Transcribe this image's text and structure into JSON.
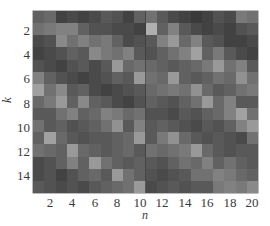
{
  "chart_data": {
    "type": "heatmap",
    "title": "",
    "xlabel": "n",
    "ylabel": "k",
    "x_ticks": [
      "2",
      "4",
      "6",
      "8",
      "10",
      "12",
      "14",
      "16",
      "18",
      "20"
    ],
    "y_ticks": [
      "2",
      "4",
      "6",
      "8",
      "10",
      "12",
      "14"
    ],
    "x_range": [
      1,
      20
    ],
    "y_range": [
      1,
      15
    ],
    "colormap": "gray",
    "color_low": "#2a2a2a",
    "color_high": "#c8c8c8",
    "grid": false,
    "divider_at_n": 10.5,
    "rows": 15,
    "cols": 20,
    "values": [
      [
        0.35,
        0.4,
        0.15,
        0.2,
        0.15,
        0.2,
        0.3,
        0.25,
        0.15,
        0.35,
        0.45,
        0.3,
        0.2,
        0.15,
        0.1,
        0.15,
        0.25,
        0.2,
        0.5,
        0.45
      ],
      [
        0.45,
        0.5,
        0.55,
        0.55,
        0.35,
        0.25,
        0.25,
        0.2,
        0.2,
        0.15,
        0.85,
        0.35,
        0.55,
        0.3,
        0.2,
        0.15,
        0.2,
        0.15,
        0.25,
        0.3
      ],
      [
        0.2,
        0.25,
        0.6,
        0.45,
        0.55,
        0.45,
        0.5,
        0.35,
        0.2,
        0.25,
        0.3,
        0.55,
        0.7,
        0.4,
        0.55,
        0.3,
        0.25,
        0.15,
        0.15,
        0.2
      ],
      [
        0.15,
        0.2,
        0.25,
        0.35,
        0.3,
        0.6,
        0.5,
        0.45,
        0.55,
        0.3,
        0.25,
        0.35,
        0.45,
        0.55,
        0.75,
        0.35,
        0.5,
        0.3,
        0.2,
        0.15
      ],
      [
        0.25,
        0.2,
        0.15,
        0.25,
        0.3,
        0.2,
        0.3,
        0.7,
        0.4,
        0.45,
        0.4,
        0.35,
        0.3,
        0.35,
        0.4,
        0.5,
        0.7,
        0.45,
        0.55,
        0.3
      ],
      [
        0.55,
        0.35,
        0.25,
        0.2,
        0.15,
        0.2,
        0.25,
        0.35,
        0.3,
        0.7,
        0.45,
        0.4,
        0.7,
        0.35,
        0.3,
        0.35,
        0.45,
        0.4,
        0.65,
        0.45
      ],
      [
        0.75,
        0.45,
        0.6,
        0.3,
        0.35,
        0.2,
        0.15,
        0.2,
        0.25,
        0.3,
        0.4,
        0.45,
        0.5,
        0.45,
        0.65,
        0.4,
        0.3,
        0.35,
        0.45,
        0.5
      ],
      [
        0.4,
        0.5,
        0.7,
        0.35,
        0.6,
        0.35,
        0.3,
        0.2,
        0.15,
        0.25,
        0.35,
        0.3,
        0.25,
        0.35,
        0.45,
        0.7,
        0.4,
        0.55,
        0.3,
        0.3
      ],
      [
        0.3,
        0.3,
        0.45,
        0.55,
        0.35,
        0.4,
        0.55,
        0.5,
        0.4,
        0.45,
        0.25,
        0.25,
        0.2,
        0.3,
        0.25,
        0.35,
        0.4,
        0.55,
        0.75,
        0.45
      ],
      [
        0.45,
        0.3,
        0.35,
        0.25,
        0.3,
        0.35,
        0.45,
        0.65,
        0.3,
        0.55,
        0.3,
        0.35,
        0.3,
        0.25,
        0.2,
        0.3,
        0.25,
        0.35,
        0.55,
        0.7
      ],
      [
        0.35,
        0.75,
        0.4,
        0.3,
        0.25,
        0.3,
        0.3,
        0.35,
        0.4,
        0.7,
        0.3,
        0.5,
        0.65,
        0.4,
        0.3,
        0.25,
        0.3,
        0.25,
        0.2,
        0.45
      ],
      [
        0.45,
        0.4,
        0.35,
        0.7,
        0.4,
        0.35,
        0.3,
        0.35,
        0.4,
        0.3,
        0.45,
        0.4,
        0.45,
        0.5,
        0.7,
        0.4,
        0.3,
        0.25,
        0.3,
        0.3
      ],
      [
        0.2,
        0.25,
        0.35,
        0.55,
        0.35,
        0.7,
        0.45,
        0.35,
        0.3,
        0.35,
        0.3,
        0.25,
        0.35,
        0.45,
        0.4,
        0.55,
        0.35,
        0.45,
        0.35,
        0.3
      ],
      [
        0.2,
        0.25,
        0.15,
        0.25,
        0.35,
        0.4,
        0.3,
        0.7,
        0.45,
        0.35,
        0.25,
        0.2,
        0.25,
        0.3,
        0.45,
        0.45,
        0.55,
        0.5,
        0.4,
        0.35
      ],
      [
        0.3,
        0.25,
        0.2,
        0.25,
        0.2,
        0.3,
        0.35,
        0.4,
        0.45,
        0.7,
        0.2,
        0.25,
        0.3,
        0.25,
        0.3,
        0.3,
        0.5,
        0.55,
        0.5,
        0.6
      ]
    ]
  }
}
